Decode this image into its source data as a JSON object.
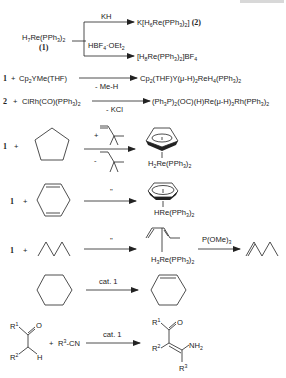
{
  "header": {
    "corner_label": ""
  },
  "scheme_1": {
    "reactant": "H7Re(PPh3)2",
    "reactant_label": "(1)",
    "upper_reagent": "KH",
    "upper_product": "K[H6Re(PPh3)2] (2)",
    "lower_reagent": "HBF4·OEt2",
    "lower_product": "[H8Re(PPh3)2]BF4"
  },
  "scheme_2": {
    "reactant_id": "1",
    "plus": "+",
    "reagent": "Cp2YMe(THF)",
    "byproduct": "- Me-H",
    "product": "Cp2(THF)Y(μ-H)2ReH4(PPh3)2"
  },
  "scheme_3": {
    "reactant_id": "2",
    "plus": "+",
    "reagent": "ClRh(CO)(PPh3)2",
    "byproduct": "- KCl",
    "product": "(Ph3P)2(OC)(H)Re(μ-H)3Rh(PPh3)2"
  },
  "scheme_4": {
    "reactant_id": "1",
    "plus": "+",
    "substrate": "cyclopentane",
    "above_sign": "+",
    "below_sign": "-",
    "product_fragment": "H2Re(PPh3)2"
  },
  "scheme_5": {
    "reactant_id": "1",
    "plus": "+",
    "substrate": "1,4-cyclohexadiene",
    "condition": "\"",
    "product_fragment": "HRe(PPh3)2"
  },
  "scheme_6": {
    "reactant_id": "1",
    "plus": "+",
    "substrate": "pentane",
    "condition": "\"",
    "intermediate_fragment": "H3Re(PPh3)2",
    "second_reagent": "P(OMe)3",
    "product": "1-pentene"
  },
  "scheme_7": {
    "substrate": "cyclohexane",
    "condition": "cat. 1",
    "product": "cyclohexene"
  },
  "scheme_8": {
    "substituents": [
      "R1",
      "R2",
      "R3"
    ],
    "ketone_atoms": [
      "O",
      "H"
    ],
    "plus": "+",
    "nitrile": "R3-CN",
    "condition": "cat. 1",
    "product_group": "NH2"
  }
}
